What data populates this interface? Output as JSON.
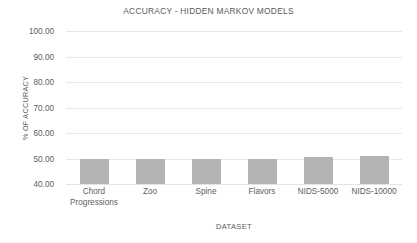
{
  "chart_data": {
    "type": "bar",
    "title": "ACCURACY - HIDDEN MARKOV MODELS",
    "xlabel": "DATASET",
    "ylabel": "% OF ACCURACY",
    "categories": [
      "Chord Progressions",
      "Zoo",
      "Spine",
      "Flavors",
      "NIDS-5000",
      "NIDS-10000"
    ],
    "values": [
      50.0,
      50.0,
      50.0,
      50.0,
      50.5,
      51.0
    ],
    "ylim": [
      40.0,
      100.0
    ],
    "yticks": [
      100.0,
      90.0,
      80.0,
      70.0,
      60.0,
      50.0,
      40.0
    ],
    "ytick_labels": [
      "100.00",
      "90.00",
      "80.00",
      "70.00",
      "60.00",
      "50.00",
      "40.00"
    ],
    "grid": true,
    "legend": false,
    "series_color": "#b3b3b3",
    "grid_color": "#e8e8e8",
    "background": "#ffffff"
  }
}
